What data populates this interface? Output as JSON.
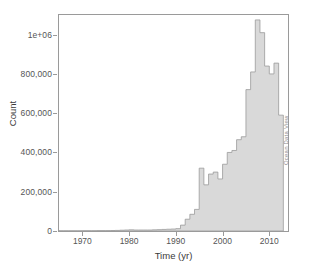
{
  "chart_data": {
    "type": "bar",
    "title": "",
    "subtitle": "",
    "xlabel": "Time (yr)",
    "ylabel": "Count",
    "xlim": [
      1965,
      2014
    ],
    "ylim": [
      0,
      1100000
    ],
    "grid": false,
    "legend": null,
    "bin_width": 1,
    "x_ticks": [
      1970,
      1980,
      1990,
      2000,
      2010
    ],
    "x_tick_labels": [
      "1970",
      "1980",
      "1990",
      "2000",
      "2010"
    ],
    "y_ticks": [
      0,
      200000,
      400000,
      600000,
      800000,
      1000000
    ],
    "y_tick_labels": [
      "0",
      "200,000",
      "400,000",
      "600,000",
      "800,000",
      "1e+06"
    ],
    "bar_fill_color": "#d9d9d9",
    "bar_edge_color": "#9a9a9a",
    "axis_color": "#9a9a9a",
    "annotations": [
      "Ocean Data View"
    ],
    "categories": [
      1965,
      1966,
      1967,
      1968,
      1969,
      1970,
      1971,
      1972,
      1973,
      1974,
      1975,
      1976,
      1977,
      1978,
      1979,
      1980,
      1981,
      1982,
      1983,
      1984,
      1985,
      1986,
      1987,
      1988,
      1989,
      1990,
      1991,
      1992,
      1993,
      1994,
      1995,
      1996,
      1997,
      1998,
      1999,
      2000,
      2001,
      2002,
      2003,
      2004,
      2005,
      2006,
      2007,
      2008,
      2009,
      2010,
      2011,
      2012
    ],
    "values": [
      1000,
      1000,
      1000,
      1000,
      1000,
      1500,
      1500,
      1500,
      2000,
      2000,
      2000,
      2500,
      3000,
      4000,
      5000,
      6000,
      5000,
      5000,
      5000,
      5000,
      6000,
      7000,
      8000,
      9000,
      10000,
      12000,
      30000,
      60000,
      85000,
      110000,
      320000,
      235000,
      290000,
      300000,
      265000,
      340000,
      400000,
      410000,
      465000,
      480000,
      720000,
      810000,
      1075000,
      1010000,
      840000,
      800000,
      855000,
      590000
    ]
  },
  "watermark": {
    "text": "Ocean Data View"
  }
}
